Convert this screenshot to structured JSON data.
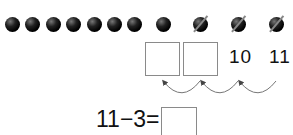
{
  "dots": {
    "filled": [
      {
        "x": 12
      },
      {
        "x": 32
      },
      {
        "x": 53
      },
      {
        "x": 73
      },
      {
        "x": 94
      },
      {
        "x": 114
      },
      {
        "x": 134
      },
      {
        "x": 163
      }
    ],
    "crossed": [
      {
        "x": 200
      },
      {
        "x": 238
      },
      {
        "x": 276
      }
    ]
  },
  "sequence": {
    "blank_boxes": 2,
    "numbers": [
      "10",
      "11"
    ]
  },
  "equation": {
    "text": "11−3=",
    "answer": ""
  }
}
